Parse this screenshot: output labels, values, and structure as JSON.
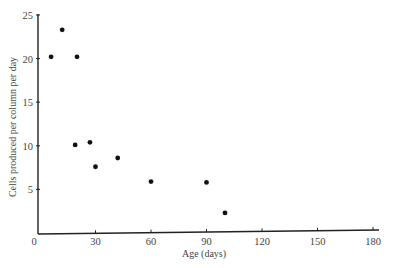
{
  "chart_data": {
    "type": "scatter",
    "title": "",
    "xlabel": "Age (days)",
    "ylabel": "Cells produced per column per day",
    "xlim": [
      0,
      180
    ],
    "ylim": [
      0,
      25
    ],
    "xticks": [
      0,
      30,
      60,
      90,
      120,
      150,
      180
    ],
    "yticks": [
      5,
      10,
      15,
      20,
      25
    ],
    "grid": false,
    "legend": null,
    "series": [
      {
        "name": "cells",
        "points": [
          {
            "x": 6,
            "y": 20.2
          },
          {
            "x": 12,
            "y": 23.3
          },
          {
            "x": 20,
            "y": 20.2
          },
          {
            "x": 19,
            "y": 10.1
          },
          {
            "x": 27,
            "y": 10.4
          },
          {
            "x": 30,
            "y": 7.6
          },
          {
            "x": 42,
            "y": 8.6
          },
          {
            "x": 60,
            "y": 5.9
          },
          {
            "x": 90,
            "y": 5.8
          },
          {
            "x": 100,
            "y": 2.3
          }
        ]
      }
    ]
  },
  "labels": {
    "x_axis": "Age (days)",
    "y_axis": "Cells produced per column per day",
    "x_ticks": [
      "0",
      "30",
      "60",
      "90",
      "120",
      "150",
      "180"
    ],
    "y_ticks": [
      "5",
      "10",
      "15",
      "20",
      "25"
    ]
  },
  "caption_fragment": "…  …  …   …  …    …  …  …  …"
}
